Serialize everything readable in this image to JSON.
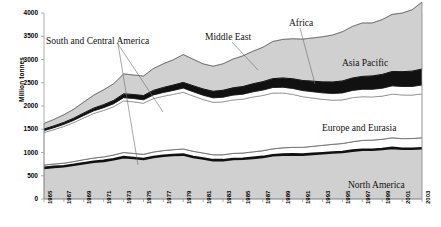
{
  "chart_data": {
    "type": "area",
    "title": "",
    "xlabel": "",
    "ylabel": "Million tonnes",
    "ylim": [
      0,
      4000
    ],
    "ytick_step": 500,
    "yticks": [
      "4000",
      "3500",
      "3000",
      "2500",
      "2000",
      "1500",
      "1000",
      "500",
      "0"
    ],
    "grid": false,
    "legend": "in-plot annotations with leader lines",
    "stacked": true,
    "x": [
      1965,
      1966,
      1967,
      1968,
      1969,
      1970,
      1971,
      1972,
      1973,
      1974,
      1975,
      1976,
      1977,
      1978,
      1979,
      1980,
      1981,
      1982,
      1983,
      1984,
      1985,
      1986,
      1987,
      1988,
      1989,
      1990,
      1991,
      1992,
      1993,
      1994,
      1995,
      1996,
      1997,
      1998,
      1999,
      2000,
      2001,
      2002,
      2003
    ],
    "xticks": [
      "1965",
      "1967",
      "1969",
      "1971",
      "1973",
      "1975",
      "1977",
      "1979",
      "1981",
      "1983",
      "1985",
      "1987",
      "1989",
      "1991",
      "1993",
      "1995",
      "1997",
      "1999",
      "2001",
      "2003"
    ],
    "series": [
      {
        "name": "North America",
        "color": "#d0d0d0",
        "values": [
          670,
          690,
          705,
          735,
          770,
          800,
          820,
          855,
          900,
          880,
          860,
          905,
          930,
          945,
          955,
          905,
          870,
          835,
          835,
          860,
          865,
          885,
          905,
          940,
          955,
          960,
          955,
          970,
          985,
          1000,
          1010,
          1040,
          1060,
          1060,
          1075,
          1100,
          1080,
          1080,
          1090
        ]
      },
      {
        "name": "South and Central America",
        "color": "#ffffff",
        "values": [
          60,
          62,
          65,
          70,
          75,
          80,
          85,
          90,
          100,
          100,
          100,
          105,
          110,
          115,
          120,
          120,
          118,
          115,
          115,
          120,
          122,
          128,
          132,
          138,
          145,
          150,
          155,
          162,
          168,
          175,
          182,
          190,
          200,
          205,
          208,
          215,
          218,
          220,
          225
        ]
      },
      {
        "name": "Europe and Eurasia",
        "color": "#ffffff",
        "values": [
          700,
          740,
          790,
          840,
          900,
          960,
          1000,
          1040,
          1110,
          1110,
          1100,
          1150,
          1170,
          1190,
          1220,
          1190,
          1150,
          1130,
          1140,
          1150,
          1160,
          1180,
          1190,
          1200,
          1180,
          1140,
          1090,
          1040,
          990,
          950,
          940,
          950,
          940,
          930,
          930,
          940,
          940,
          935,
          945
        ]
      },
      {
        "name": "Africa",
        "color": "#ffffff",
        "values": [
          40,
          42,
          45,
          48,
          52,
          56,
          60,
          64,
          70,
          72,
          74,
          78,
          82,
          86,
          90,
          92,
          94,
          96,
          100,
          104,
          108,
          112,
          116,
          120,
          124,
          128,
          132,
          136,
          140,
          145,
          150,
          155,
          160,
          165,
          170,
          178,
          182,
          186,
          192
        ]
      },
      {
        "name": "Middle East",
        "color": "#111111",
        "values": [
          35,
          38,
          42,
          46,
          52,
          58,
          64,
          70,
          80,
          85,
          90,
          98,
          106,
          114,
          122,
          128,
          134,
          140,
          148,
          156,
          164,
          172,
          180,
          190,
          198,
          208,
          216,
          226,
          236,
          246,
          256,
          266,
          276,
          286,
          296,
          308,
          318,
          328,
          342
        ]
      },
      {
        "name": "Asia Pacific",
        "color": "#d0d0d0",
        "values": [
          120,
          140,
          165,
          195,
          235,
          280,
          320,
          360,
          430,
          420,
          420,
          470,
          510,
          545,
          600,
          570,
          540,
          540,
          570,
          620,
          660,
          700,
          740,
          800,
          830,
          860,
          890,
          930,
          970,
          1010,
          1060,
          1110,
          1150,
          1140,
          1180,
          1230,
          1260,
          1320,
          1440
        ]
      }
    ],
    "annotations": [
      {
        "label": "South and Central America",
        "x": 46,
        "y": 36
      },
      {
        "label": "Middle East",
        "x": 205,
        "y": 32
      },
      {
        "label": "Africa",
        "x": 289,
        "y": 18
      },
      {
        "label": "Asia Pacific",
        "x": 342,
        "y": 58
      },
      {
        "label": "Europe and Eurasia",
        "x": 322,
        "y": 123
      },
      {
        "label": "North America",
        "x": 348,
        "y": 180
      }
    ]
  }
}
